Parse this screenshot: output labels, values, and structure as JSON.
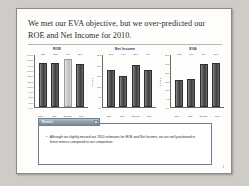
{
  "slide": {
    "title": "We met our EVA objective, but we over-predicted our ROE and Net Income for 2010.",
    "page_number": "3"
  },
  "callout": {
    "tab_label": "Results",
    "bullet_marker": "•",
    "bullet_text": "Although we slightly missed our 2010 estimates for ROE and Net Income, we are well positioned in these metrics compared to our competition."
  },
  "chart_data": [
    {
      "type": "bar",
      "title": "ROE",
      "xlabel": "",
      "ylabel": "",
      "categories": [
        "2008",
        "2009",
        "2010 Est.",
        "2010"
      ],
      "values": [
        13.6,
        13.5,
        14.8,
        13.1
      ],
      "value_labels": [
        "13.6",
        "13.5",
        "14.8",
        "13.1"
      ],
      "ylim": [
        0,
        16
      ],
      "yticks": [
        "16.0%",
        "15.0%",
        "14.0%",
        "13.0%",
        "12.0%",
        "11.0%",
        "10.0%",
        "9.0%",
        "8.0%",
        "7.0%",
        "6.0%"
      ],
      "highlight_index": 2,
      "grid": false,
      "legend": "none"
    },
    {
      "type": "bar",
      "title": "Net Income",
      "xlabel": "",
      "ylabel": "$ Millions",
      "categories": [
        "2008",
        "2009",
        "2010 Est.",
        "2010"
      ],
      "values": [
        17.6,
        14.8,
        20.1,
        17.9
      ],
      "value_labels": [
        "17.6",
        "14.8",
        "20.1",
        "17.9"
      ],
      "ylim": [
        0,
        25
      ],
      "yticks": [
        "25.0",
        "20.0",
        "15.0",
        "10.0",
        "5.0",
        "0.0"
      ],
      "highlight_index": -1,
      "grid": false,
      "legend": "none"
    },
    {
      "type": "bar",
      "title": "EVA",
      "xlabel": "",
      "ylabel": "$ Millions",
      "categories": [
        "2008",
        "2009",
        "2010 Est.",
        "2010"
      ],
      "values": [
        10.3,
        10.7,
        16.4,
        17.1
      ],
      "value_labels": [
        "10.3",
        "10.7",
        "16.4",
        "17.1"
      ],
      "ylim": [
        0,
        20
      ],
      "yticks": [
        "20.0",
        "17.5",
        "15.0",
        "12.5",
        "10.0",
        "7.5",
        "5.0"
      ],
      "highlight_index": -1,
      "grid": false,
      "legend": "none"
    }
  ]
}
